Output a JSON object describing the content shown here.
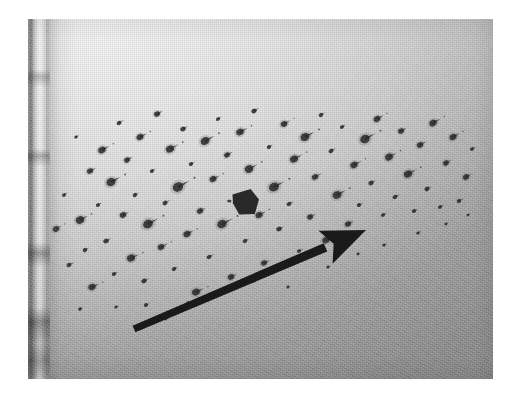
{
  "image": {
    "kind": "photograph",
    "subject": "blood-spatter-pattern-on-light-surface",
    "medium": "black-and-white-halftone-print",
    "alt_text": "Grainy black and white photograph of a light gray surface covered with dark spatter droplets, with a large black arrow pointing up and to the right and a small dark arrowhead marker near the center.",
    "canvas_width": 516,
    "canvas_height": 396,
    "background_color": "#ffffff"
  },
  "photo": {
    "name": "spatter-photograph",
    "left": 28,
    "top": 19,
    "width": 465,
    "height": 360,
    "tone_light": "#f4f4f4",
    "tone_mid": "#c8c8c8",
    "tone_dark": "#a4a4a4",
    "grain_opacity": 0.4
  },
  "left_edge": {
    "name": "substrate-left-edge-band",
    "x": 0,
    "width": 22,
    "tone_dark": "#606060",
    "tone_light": "#ffffff"
  },
  "annotations": {
    "main_arrow": {
      "name": "direction-arrow",
      "color": "#1a1a1a",
      "tail_x": 106,
      "tail_y": 310,
      "tip_x": 338,
      "tip_y": 211,
      "shaft_width": 9,
      "head_length": 44,
      "head_width": 36,
      "angle_deg": -23,
      "meaning": "direction-of-travel"
    },
    "marker_arrowhead": {
      "name": "point-of-origin-marker",
      "color": "#2a2a2a",
      "center_x": 218,
      "center_y": 183,
      "width": 26,
      "height": 25,
      "meaning": "secondary-arrowhead-marker"
    }
  },
  "spatter": {
    "name": "spatter-droplet-field",
    "droplet_color": "#2e2e2e",
    "count": 96,
    "tail_direction_deg": -28,
    "description": "Directional spatter droplets with elongated comet-like tails oriented up and to the right.",
    "droplets": [
      {
        "x": 28,
        "y": 210,
        "r": 3.1,
        "tail": 7,
        "ang": -30
      },
      {
        "x": 36,
        "y": 176,
        "r": 2.0,
        "tail": 5,
        "ang": -34
      },
      {
        "x": 41,
        "y": 246,
        "r": 2.4,
        "tail": 6,
        "ang": -26
      },
      {
        "x": 48,
        "y": 118,
        "r": 1.7,
        "tail": 4,
        "ang": -30
      },
      {
        "x": 52,
        "y": 201,
        "r": 4.0,
        "tail": 9,
        "ang": -28
      },
      {
        "x": 57,
        "y": 231,
        "r": 2.2,
        "tail": 5,
        "ang": -31
      },
      {
        "x": 62,
        "y": 152,
        "r": 2.9,
        "tail": 7,
        "ang": -27
      },
      {
        "x": 64,
        "y": 268,
        "r": 3.4,
        "tail": 8,
        "ang": -24
      },
      {
        "x": 70,
        "y": 186,
        "r": 2.0,
        "tail": 5,
        "ang": -33
      },
      {
        "x": 74,
        "y": 131,
        "r": 3.6,
        "tail": 9,
        "ang": -29
      },
      {
        "x": 78,
        "y": 222,
        "r": 2.6,
        "tail": 6,
        "ang": -26
      },
      {
        "x": 83,
        "y": 163,
        "r": 4.4,
        "tail": 11,
        "ang": -28
      },
      {
        "x": 86,
        "y": 255,
        "r": 2.1,
        "tail": 5,
        "ang": -30
      },
      {
        "x": 91,
        "y": 104,
        "r": 2.3,
        "tail": 6,
        "ang": -32
      },
      {
        "x": 95,
        "y": 196,
        "r": 3.0,
        "tail": 7,
        "ang": -27
      },
      {
        "x": 99,
        "y": 141,
        "r": 2.7,
        "tail": 7,
        "ang": -29
      },
      {
        "x": 103,
        "y": 239,
        "r": 3.8,
        "tail": 9,
        "ang": -25
      },
      {
        "x": 107,
        "y": 176,
        "r": 2.2,
        "tail": 5,
        "ang": -31
      },
      {
        "x": 112,
        "y": 118,
        "r": 3.3,
        "tail": 8,
        "ang": -28
      },
      {
        "x": 116,
        "y": 262,
        "r": 2.5,
        "tail": 6,
        "ang": -26
      },
      {
        "x": 120,
        "y": 205,
        "r": 4.7,
        "tail": 12,
        "ang": -28
      },
      {
        "x": 124,
        "y": 152,
        "r": 2.0,
        "tail": 5,
        "ang": -33
      },
      {
        "x": 129,
        "y": 95,
        "r": 2.8,
        "tail": 7,
        "ang": -30
      },
      {
        "x": 133,
        "y": 228,
        "r": 3.1,
        "tail": 8,
        "ang": -27
      },
      {
        "x": 137,
        "y": 184,
        "r": 2.4,
        "tail": 6,
        "ang": -29
      },
      {
        "x": 142,
        "y": 130,
        "r": 3.9,
        "tail": 10,
        "ang": -28
      },
      {
        "x": 146,
        "y": 250,
        "r": 2.2,
        "tail": 5,
        "ang": -25
      },
      {
        "x": 150,
        "y": 168,
        "r": 5.0,
        "tail": 13,
        "ang": -29
      },
      {
        "x": 155,
        "y": 110,
        "r": 2.6,
        "tail": 6,
        "ang": -31
      },
      {
        "x": 159,
        "y": 215,
        "r": 3.4,
        "tail": 8,
        "ang": -27
      },
      {
        "x": 163,
        "y": 145,
        "r": 2.1,
        "tail": 5,
        "ang": -30
      },
      {
        "x": 168,
        "y": 273,
        "r": 3.7,
        "tail": 9,
        "ang": -24
      },
      {
        "x": 172,
        "y": 192,
        "r": 2.9,
        "tail": 7,
        "ang": -28
      },
      {
        "x": 177,
        "y": 122,
        "r": 4.2,
        "tail": 11,
        "ang": -29
      },
      {
        "x": 181,
        "y": 238,
        "r": 2.3,
        "tail": 6,
        "ang": -26
      },
      {
        "x": 185,
        "y": 160,
        "r": 3.2,
        "tail": 8,
        "ang": -28
      },
      {
        "x": 190,
        "y": 100,
        "r": 2.0,
        "tail": 5,
        "ang": -32
      },
      {
        "x": 194,
        "y": 205,
        "r": 4.5,
        "tail": 12,
        "ang": -27
      },
      {
        "x": 199,
        "y": 136,
        "r": 2.7,
        "tail": 7,
        "ang": -30
      },
      {
        "x": 203,
        "y": 258,
        "r": 3.0,
        "tail": 7,
        "ang": -25
      },
      {
        "x": 208,
        "y": 178,
        "r": 2.4,
        "tail": 6,
        "ang": -29
      },
      {
        "x": 212,
        "y": 113,
        "r": 3.6,
        "tail": 9,
        "ang": -28
      },
      {
        "x": 217,
        "y": 222,
        "r": 2.2,
        "tail": 5,
        "ang": -27
      },
      {
        "x": 221,
        "y": 150,
        "r": 4.0,
        "tail": 10,
        "ang": -29
      },
      {
        "x": 226,
        "y": 92,
        "r": 2.5,
        "tail": 6,
        "ang": -31
      },
      {
        "x": 231,
        "y": 196,
        "r": 3.3,
        "tail": 8,
        "ang": -28
      },
      {
        "x": 236,
        "y": 244,
        "r": 2.8,
        "tail": 7,
        "ang": -25
      },
      {
        "x": 241,
        "y": 128,
        "r": 2.1,
        "tail": 5,
        "ang": -30
      },
      {
        "x": 246,
        "y": 168,
        "r": 4.8,
        "tail": 12,
        "ang": -28
      },
      {
        "x": 251,
        "y": 210,
        "r": 2.6,
        "tail": 6,
        "ang": -27
      },
      {
        "x": 256,
        "y": 105,
        "r": 3.1,
        "tail": 8,
        "ang": -29
      },
      {
        "x": 261,
        "y": 185,
        "r": 2.3,
        "tail": 6,
        "ang": -28
      },
      {
        "x": 266,
        "y": 140,
        "r": 3.8,
        "tail": 10,
        "ang": -29
      },
      {
        "x": 271,
        "y": 232,
        "r": 2.0,
        "tail": 5,
        "ang": -26
      },
      {
        "x": 277,
        "y": 118,
        "r": 4.3,
        "tail": 11,
        "ang": -28
      },
      {
        "x": 282,
        "y": 198,
        "r": 2.7,
        "tail": 7,
        "ang": -27
      },
      {
        "x": 287,
        "y": 158,
        "r": 3.0,
        "tail": 8,
        "ang": -29
      },
      {
        "x": 293,
        "y": 96,
        "r": 2.2,
        "tail": 5,
        "ang": -31
      },
      {
        "x": 298,
        "y": 221,
        "r": 3.5,
        "tail": 9,
        "ang": -26
      },
      {
        "x": 303,
        "y": 132,
        "r": 2.4,
        "tail": 6,
        "ang": -30
      },
      {
        "x": 309,
        "y": 176,
        "r": 4.1,
        "tail": 10,
        "ang": -28
      },
      {
        "x": 314,
        "y": 108,
        "r": 2.0,
        "tail": 5,
        "ang": -32
      },
      {
        "x": 320,
        "y": 205,
        "r": 2.9,
        "tail": 7,
        "ang": -27
      },
      {
        "x": 326,
        "y": 146,
        "r": 3.4,
        "tail": 9,
        "ang": -29
      },
      {
        "x": 331,
        "y": 186,
        "r": 2.1,
        "tail": 5,
        "ang": -28
      },
      {
        "x": 337,
        "y": 120,
        "r": 4.6,
        "tail": 12,
        "ang": -28
      },
      {
        "x": 343,
        "y": 164,
        "r": 2.5,
        "tail": 6,
        "ang": -29
      },
      {
        "x": 349,
        "y": 100,
        "r": 3.2,
        "tail": 8,
        "ang": -30
      },
      {
        "x": 355,
        "y": 196,
        "r": 2.0,
        "tail": 5,
        "ang": -27
      },
      {
        "x": 361,
        "y": 138,
        "r": 3.7,
        "tail": 9,
        "ang": -29
      },
      {
        "x": 367,
        "y": 178,
        "r": 2.3,
        "tail": 6,
        "ang": -28
      },
      {
        "x": 373,
        "y": 112,
        "r": 2.8,
        "tail": 7,
        "ang": -30
      },
      {
        "x": 380,
        "y": 155,
        "r": 3.9,
        "tail": 10,
        "ang": -28
      },
      {
        "x": 386,
        "y": 192,
        "r": 2.1,
        "tail": 5,
        "ang": -27
      },
      {
        "x": 392,
        "y": 126,
        "r": 3.0,
        "tail": 8,
        "ang": -29
      },
      {
        "x": 399,
        "y": 170,
        "r": 2.4,
        "tail": 6,
        "ang": -28
      },
      {
        "x": 405,
        "y": 104,
        "r": 3.5,
        "tail": 9,
        "ang": -30
      },
      {
        "x": 412,
        "y": 188,
        "r": 2.0,
        "tail": 5,
        "ang": -27
      },
      {
        "x": 418,
        "y": 144,
        "r": 2.7,
        "tail": 7,
        "ang": -29
      },
      {
        "x": 425,
        "y": 118,
        "r": 3.3,
        "tail": 8,
        "ang": -29
      },
      {
        "x": 431,
        "y": 182,
        "r": 2.2,
        "tail": 6,
        "ang": -28
      },
      {
        "x": 438,
        "y": 158,
        "r": 2.9,
        "tail": 7,
        "ang": -29
      },
      {
        "x": 444,
        "y": 130,
        "r": 2.0,
        "tail": 5,
        "ang": -30
      },
      {
        "x": 160,
        "y": 284,
        "r": 1.8,
        "tail": 4,
        "ang": -26
      },
      {
        "x": 118,
        "y": 286,
        "r": 2.0,
        "tail": 5,
        "ang": -25
      },
      {
        "x": 196,
        "y": 270,
        "r": 1.9,
        "tail": 4,
        "ang": -26
      },
      {
        "x": 226,
        "y": 262,
        "r": 1.7,
        "tail": 4,
        "ang": -27
      },
      {
        "x": 300,
        "y": 248,
        "r": 1.6,
        "tail": 4,
        "ang": -27
      },
      {
        "x": 330,
        "y": 235,
        "r": 1.5,
        "tail": 3,
        "ang": -28
      },
      {
        "x": 356,
        "y": 226,
        "r": 1.6,
        "tail": 4,
        "ang": -28
      },
      {
        "x": 390,
        "y": 214,
        "r": 1.7,
        "tail": 4,
        "ang": -28
      },
      {
        "x": 418,
        "y": 205,
        "r": 1.5,
        "tail": 3,
        "ang": -28
      },
      {
        "x": 440,
        "y": 196,
        "r": 1.4,
        "tail": 3,
        "ang": -28
      },
      {
        "x": 88,
        "y": 288,
        "r": 1.6,
        "tail": 4,
        "ang": -25
      },
      {
        "x": 52,
        "y": 290,
        "r": 1.8,
        "tail": 4,
        "ang": -24
      },
      {
        "x": 138,
        "y": 300,
        "r": 1.4,
        "tail": 3,
        "ang": -25
      },
      {
        "x": 260,
        "y": 268,
        "r": 1.5,
        "tail": 3,
        "ang": -26
      }
    ]
  }
}
